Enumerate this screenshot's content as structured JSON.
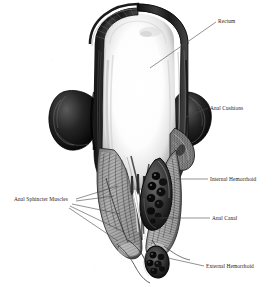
{
  "figure": {
    "style": "black and white engraved medical illustration",
    "background_color": "#ffffff",
    "ink_color": "#1b1b1b"
  },
  "labels": {
    "rectum": "Rectum",
    "anal_cushions": "Anal Cushions",
    "internal_hemorrhoid": "Internal Hemorrhoid",
    "anal_canal": "Anal Canal",
    "external_hemorrhoid": "External Hemorrhoid",
    "anal_sphincter_muscles": "Anal Sphincter Muscles"
  },
  "structures": [
    {
      "name": "rectum",
      "description": "wide arched rectal ampulla with bright lumen"
    },
    {
      "name": "anal-cushions",
      "description": "vascular cushions at upper anal canal"
    },
    {
      "name": "internal-hemorrhoid",
      "description": "teardrop mass of dilated veins above dentate line"
    },
    {
      "name": "anal-canal",
      "description": "narrow distal canal"
    },
    {
      "name": "external-hemorrhoid",
      "description": "oval cluster of dark veins below anal verge"
    },
    {
      "name": "anal-sphincter-muscles",
      "description": "internal and external sphincter muscle bundles"
    },
    {
      "name": "anal-columns",
      "description": "vertical mucosal columns of Morgagni"
    },
    {
      "name": "levator-bulge",
      "description": "rounded pelvic floor muscle bulge"
    }
  ]
}
